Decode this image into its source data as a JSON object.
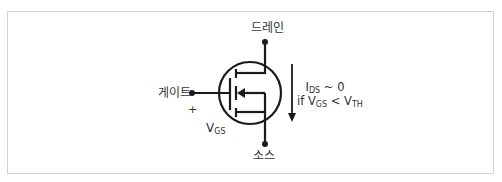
{
  "diagram": {
    "type": "n-channel enhancement MOSFET symbol",
    "terminals": {
      "drain": "드레인",
      "gate": "게이트",
      "source": "소스"
    },
    "gate_polarity": "+",
    "vgs_label": {
      "main": "V",
      "sub": "GS"
    },
    "current_condition": {
      "line1": {
        "main": "I",
        "sub": "DS",
        "rest": " ~ 0"
      },
      "line2": {
        "prefix": "if V",
        "sub1": "GS",
        "mid": " < V",
        "sub2": "TH"
      }
    },
    "current_arrow_direction": "down",
    "colors": {
      "line": "#1a1a1a",
      "text": "#333333",
      "frame": "#d4d4d4"
    }
  }
}
